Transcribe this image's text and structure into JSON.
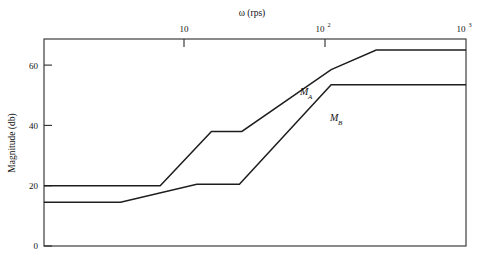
{
  "figure": {
    "background_color": "#ffffff",
    "line_color": "#1e1e1e",
    "axis_color": "#2b2b2b"
  },
  "axes": {
    "x_axis_title": "ω (rps)",
    "x_axis_position": "top",
    "x_tick_labels": [
      {
        "base": "10",
        "exponent": ""
      },
      {
        "base": "10",
        "exponent": "2"
      },
      {
        "base": "10",
        "exponent": "3"
      }
    ],
    "y_axis_title": "Magnitude (db)",
    "y_tick_labels": [
      "0",
      "20",
      "40",
      "60"
    ]
  },
  "curve_labels": [
    {
      "base": "M",
      "sub": "A"
    },
    {
      "base": "M",
      "sub": "B"
    }
  ],
  "chart_data": {
    "type": "line",
    "title": "",
    "subtitle": "",
    "xlabel": "ω (rps)",
    "ylabel": "Magnitude (db)",
    "xscale": "log",
    "xlim": [
      1,
      1000
    ],
    "ylim": [
      0,
      68.5
    ],
    "xticks": [
      10,
      100,
      1000
    ],
    "xticklabels": [
      "10",
      "10^2",
      "10^3"
    ],
    "yticks": [
      0,
      20,
      40,
      60
    ],
    "yticklabels": [
      "0",
      "20",
      "40",
      "60"
    ],
    "grid": false,
    "legend": "inline-annotations",
    "annotations": [
      {
        "text": "M_A",
        "x": 60,
        "y": 51
      },
      {
        "text": "M_B",
        "x": 120,
        "y": 42
      }
    ],
    "series": [
      {
        "name": "M_A",
        "label": "M_A",
        "x": [
          1,
          6.7,
          15.5,
          25.5,
          110,
          230,
          1000
        ],
        "y": [
          20,
          20,
          38,
          38,
          58.5,
          65,
          65
        ],
        "description": "Asymptotic Bode magnitude: flat 20 db, +slope break near 6.7 rps, plateau 38 db from 15.5 to 25.5 rps, rise to 58.5 db at 110 rps, shallower rise to 65 db at 230 rps, flat 65 db to 1000 rps"
      },
      {
        "name": "M_B",
        "label": "M_B",
        "x": [
          1,
          3.5,
          12.2,
          24.5,
          110,
          1000
        ],
        "y": [
          14.5,
          14.5,
          20.5,
          20.5,
          53.5,
          53.5
        ],
        "description": "Asymptotic Bode magnitude: flat 14.5 db, break near 3.5 rps, plateau 20.5 db from 12.2 to 24.5 rps, rise to 53.5 db at 110 rps, flat 53.5 db to 1000 rps"
      }
    ]
  }
}
